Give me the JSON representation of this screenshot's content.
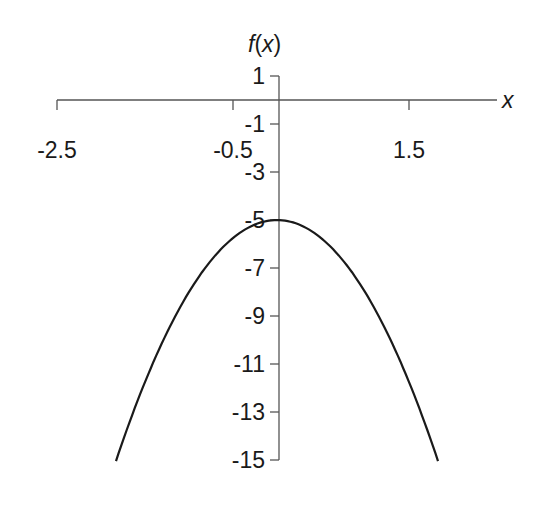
{
  "chart_data": {
    "type": "line",
    "title": "",
    "xlabel": "x",
    "ylabel": "f(x)",
    "function": "f(x) = -3x^2 - 5",
    "xlim": [
      -2.5,
      2.5
    ],
    "ylim": [
      -15,
      1
    ],
    "x_ticks": [
      -2.5,
      -0.5,
      1.5
    ],
    "x_tick_labels": [
      "-2.5",
      "-0.5",
      "1.5"
    ],
    "y_ticks": [
      1,
      -1,
      -3,
      -5,
      -7,
      -9,
      -11,
      -13,
      -15
    ],
    "y_tick_labels": [
      "1",
      "-1",
      "-3",
      "-5",
      "-7",
      "-9",
      "-11",
      "-13",
      "-15"
    ],
    "grid": false,
    "legend": null,
    "series": [
      {
        "name": "f(x)",
        "color": "#1a1a1a",
        "x": [
          -1.83,
          -1.5,
          -1.0,
          -0.5,
          0.0,
          0.5,
          1.0,
          1.5,
          1.83
        ],
        "values": [
          -15.05,
          -11.75,
          -8.0,
          -5.75,
          -5.0,
          -5.75,
          -8.0,
          -11.75,
          -15.05
        ]
      }
    ]
  },
  "labels": {
    "x_axis": "x",
    "y_axis_f": "f",
    "y_axis_paren_open": "(",
    "y_axis_x": "x",
    "y_axis_paren_close": ")"
  },
  "colors": {
    "axis": "#555555",
    "curve": "#1a1a1a",
    "text": "#1a1a1a"
  }
}
